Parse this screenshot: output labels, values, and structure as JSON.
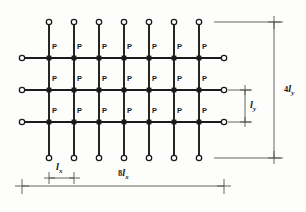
{
  "figure": {
    "type": "engineering-line-diagram",
    "canvas": {
      "width": 306,
      "height": 212
    },
    "line_color": "#1b1b1b",
    "dimension_color": "#555555",
    "background": "#fdfdfc",
    "grid": {
      "columns": 7,
      "rows": 3,
      "intersections": 21,
      "column_x": [
        49,
        74,
        99,
        124,
        149,
        174,
        199
      ],
      "row_y": [
        58,
        90,
        122
      ],
      "vertical_extent": {
        "top": 22,
        "bottom": 158
      },
      "horizontal_extent": {
        "left": 22,
        "right": 224
      }
    },
    "load_label": "P",
    "load_labels": [
      "P",
      "P",
      "P",
      "P",
      "P",
      "P",
      "P",
      "P",
      "P",
      "P",
      "P",
      "P",
      "P",
      "P",
      "P",
      "P",
      "P",
      "P",
      "P",
      "P",
      "P"
    ],
    "dimensions": {
      "spacing_x": {
        "coefficient": "",
        "symbol": "l",
        "subscript": "x",
        "text": "lx"
      },
      "total_x": {
        "coefficient": "8",
        "symbol": "l",
        "subscript": "x",
        "text": "8lx"
      },
      "spacing_y": {
        "coefficient": "",
        "symbol": "l",
        "subscript": "y",
        "text": "ly"
      },
      "total_y": {
        "coefficient": "4",
        "symbol": "l",
        "subscript": "y",
        "text": "4ly"
      }
    },
    "node_marker": "open-circle",
    "joint_marker": "filled-square"
  }
}
